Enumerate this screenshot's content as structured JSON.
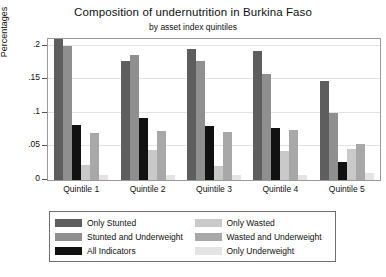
{
  "chart_data": {
    "type": "bar",
    "title": "Composition of undernutrition in Burkina Faso",
    "subtitle": "by asset index quintiles",
    "xlabel": "",
    "ylabel": "Percentages",
    "categories": [
      "Quintile 1",
      "Quintile 2",
      "Quintile 3",
      "Quintile 4",
      "Quintile 5"
    ],
    "ylim": [
      0,
      0.21
    ],
    "yticks": [
      0,
      0.05,
      0.1,
      0.15,
      0.2
    ],
    "ytick_labels": [
      "0",
      ".05",
      ".1",
      ".15",
      ".2"
    ],
    "grid": true,
    "legend_position": "below-axes",
    "series": [
      {
        "name": "Only Stunted",
        "color": "#5e5e5e",
        "values": [
          0.21,
          0.178,
          0.195,
          0.192,
          0.147
        ]
      },
      {
        "name": "Stunted and Underweight",
        "color": "#8f8f8f",
        "values": [
          0.2,
          0.186,
          0.178,
          0.158,
          0.1
        ]
      },
      {
        "name": "All Indicators",
        "color": "#111111",
        "values": [
          0.082,
          0.093,
          0.08,
          0.077,
          0.027
        ]
      },
      {
        "name": "Only Wasted",
        "color": "#c9c9c9",
        "values": [
          0.022,
          0.045,
          0.021,
          0.043,
          0.046
        ]
      },
      {
        "name": "Wasted and Underweight",
        "color": "#a8a8a8",
        "values": [
          0.07,
          0.073,
          0.072,
          0.075,
          0.053
        ]
      },
      {
        "name": "Only Underweight",
        "color": "#e4e4e4",
        "values": [
          0.007,
          0.007,
          0.007,
          0.007,
          0.011
        ]
      }
    ]
  }
}
